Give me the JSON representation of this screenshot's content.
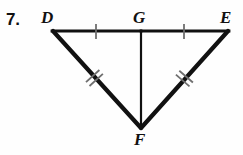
{
  "problem": {
    "number": "7."
  },
  "figure": {
    "kind": "geometry-diagram",
    "stroke_color": "#111111",
    "tick_color": "#6f6f6f",
    "background_color": "#fefefe",
    "labels": {
      "D": "D",
      "G": "G",
      "E": "E",
      "F": "F"
    },
    "points": {
      "D": {
        "x": 53,
        "y": 31
      },
      "G": {
        "x": 141,
        "y": 31
      },
      "E": {
        "x": 228,
        "y": 31
      },
      "F": {
        "x": 141,
        "y": 128
      }
    },
    "segments": [
      {
        "name": "DG",
        "from": "D",
        "to": "G",
        "ticks": 1,
        "width": 2.6
      },
      {
        "name": "GE",
        "from": "G",
        "to": "E",
        "ticks": 1,
        "width": 2.6
      },
      {
        "name": "GF",
        "from": "G",
        "to": "F",
        "ticks": 0,
        "width": 2.2
      },
      {
        "name": "DF",
        "from": "D",
        "to": "F",
        "ticks": 2,
        "width": 4.2
      },
      {
        "name": "FE",
        "from": "F",
        "to": "E",
        "ticks": 2,
        "width": 4.2
      }
    ]
  }
}
